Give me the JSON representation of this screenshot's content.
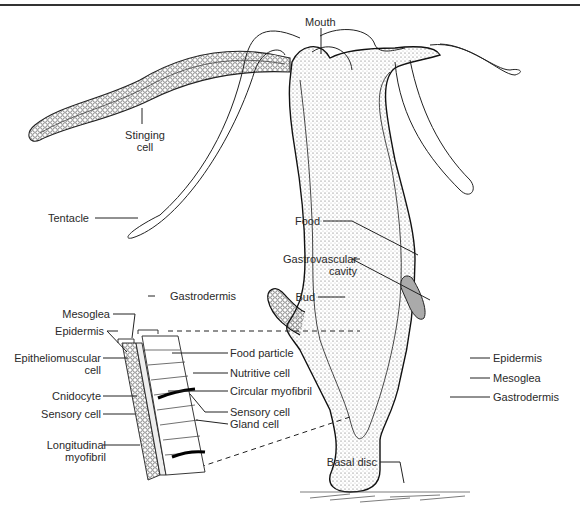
{
  "diagram": {
    "labels": {
      "mouth": "Mouth",
      "stinging_cell": [
        "Stinging",
        "cell"
      ],
      "tentacle": "Tentacle",
      "food": "Food",
      "gastrovascular_cavity": [
        "Gastrovascular",
        "cavity"
      ],
      "bud": "Bud",
      "epidermis": "Epidermis",
      "mesoglea": "Mesoglea",
      "gastrodermis": "Gastrodermis",
      "basal_disc": "Basal disc"
    },
    "inset_labels": {
      "gastrodermis": "Gastrodermis",
      "mesoglea": "Mesoglea",
      "epidermis": "Epidermis",
      "epitheliomuscular_cell": [
        "Epitheliomuscular",
        "cell"
      ],
      "cnidocyte": "Cnidocyte",
      "sensory_cell_left": "Sensory cell",
      "longitudinal_myofibril": [
        "Longitudinal",
        "myofibril"
      ],
      "food_particle": "Food particle",
      "nutritive_cell": "Nutritive cell",
      "circular_myofibril": "Circular myofibril",
      "sensory_cell_right": "Sensory cell",
      "gland_cell": "Gland cell"
    }
  }
}
